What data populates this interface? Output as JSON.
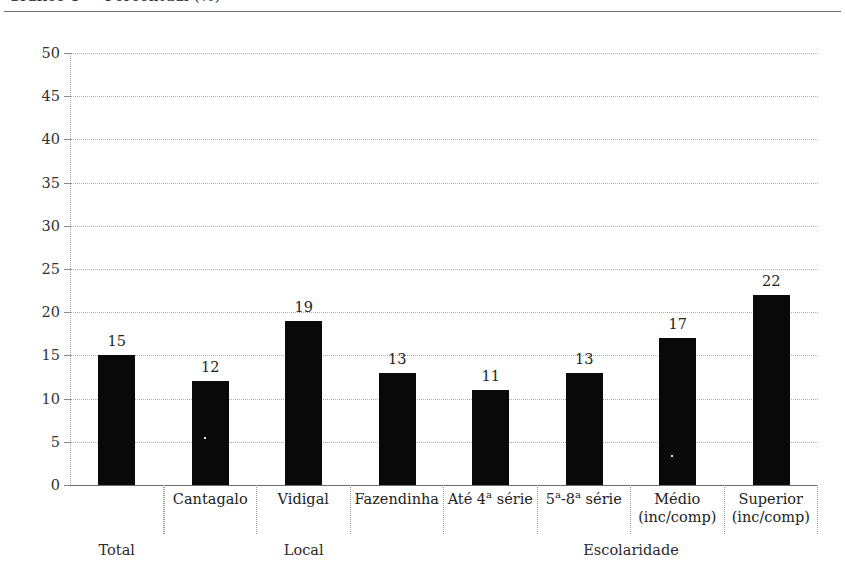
{
  "page": {
    "title_clipped": "Gráfico 1 — Percentual (%)"
  },
  "chart_data": {
    "type": "bar",
    "title": "",
    "xlabel": "",
    "ylabel": "",
    "ylim": [
      0,
      50
    ],
    "ytick_step": 5,
    "grid": true,
    "legend": "none",
    "categories": [
      "Total",
      "Cantagalo",
      "Vidigal",
      "Fazendinha",
      "Até 4ª série",
      "5ª-8ª série",
      "Médio\n(inc/comp)",
      "Superior\n(inc/comp)"
    ],
    "values": [
      15,
      12,
      19,
      13,
      11,
      13,
      17,
      22
    ],
    "yticks": [
      "0",
      "5",
      "10",
      "15",
      "20",
      "25",
      "30",
      "35",
      "40",
      "45",
      "50"
    ],
    "group_labels": [
      "Total",
      "Local",
      "Escolaridade"
    ],
    "bar_color": "#090909"
  }
}
